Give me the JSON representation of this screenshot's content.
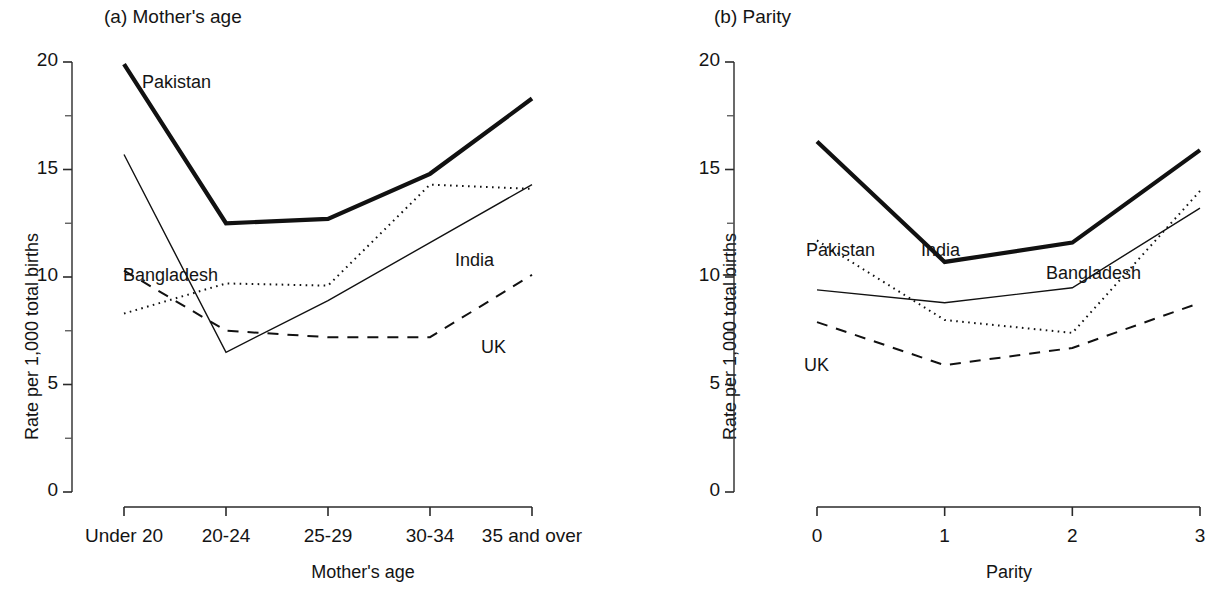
{
  "figure": {
    "panels": [
      {
        "id": "a",
        "title": "(a) Mother's age",
        "xlabel": "Mother's age",
        "ylabel": "Rate per 1,000 total births",
        "xticklabels": [
          "Under 20",
          "20-24",
          "25-29",
          "30-34",
          "35 and over"
        ],
        "yticklabels": [
          "0",
          "5",
          "10",
          "15",
          "20"
        ],
        "series_labels": {
          "pakistan": "Pakistan",
          "bangladesh": "Bangladesh",
          "india": "India",
          "uk": "UK"
        }
      },
      {
        "id": "b",
        "title": "(b) Parity",
        "xlabel": "Parity",
        "ylabel": "Rate per 1,000 total births",
        "xticklabels": [
          "0",
          "1",
          "2",
          "3"
        ],
        "yticklabels": [
          "0",
          "5",
          "10",
          "15",
          "20"
        ],
        "series_labels": {
          "pakistan": "Pakistan",
          "bangladesh": "Bangladesh",
          "india": "India",
          "uk": "UK"
        }
      }
    ]
  },
  "chart_data": [
    {
      "type": "line",
      "title": "(a) Mother's age",
      "xlabel": "Mother's age",
      "ylabel": "Rate per 1,000 total births",
      "categories": [
        "Under 20",
        "20-24",
        "25-29",
        "30-34",
        "35 and over"
      ],
      "ylim": [
        0,
        20
      ],
      "yticks": [
        0,
        5,
        10,
        15,
        20
      ],
      "yminorticks": [
        2.5,
        7.5,
        12.5,
        17.5
      ],
      "grid": false,
      "legend": "inline-labels",
      "series": [
        {
          "name": "Pakistan",
          "style": "thick-solid",
          "values": [
            19.9,
            12.5,
            12.7,
            14.8,
            18.3
          ]
        },
        {
          "name": "India",
          "style": "thin-solid",
          "values": [
            15.7,
            6.5,
            8.9,
            11.6,
            14.3
          ]
        },
        {
          "name": "Bangladesh",
          "style": "dotted",
          "values": [
            8.3,
            9.7,
            9.6,
            14.3,
            14.1
          ]
        },
        {
          "name": "UK",
          "style": "dashed",
          "values": [
            10.3,
            7.5,
            7.2,
            7.2,
            10.1
          ]
        }
      ]
    },
    {
      "type": "line",
      "title": "(b) Parity",
      "xlabel": "Parity",
      "ylabel": "Rate per 1,000 total births",
      "categories": [
        "0",
        "1",
        "2",
        "3"
      ],
      "ylim": [
        0,
        20
      ],
      "yticks": [
        0,
        5,
        10,
        15,
        20
      ],
      "yminorticks": [
        2.5,
        7.5,
        12.5,
        17.5
      ],
      "grid": false,
      "legend": "inline-labels",
      "series": [
        {
          "name": "Pakistan",
          "style": "thick-solid",
          "values": [
            16.3,
            10.7,
            11.6,
            15.9
          ]
        },
        {
          "name": "India",
          "style": "thin-solid",
          "values": [
            9.4,
            8.8,
            9.5,
            13.2
          ]
        },
        {
          "name": "Bangladesh",
          "style": "dotted",
          "values": [
            11.7,
            8.0,
            7.4,
            14.0
          ]
        },
        {
          "name": "UK",
          "style": "dashed",
          "values": [
            7.9,
            5.9,
            6.7,
            8.8
          ]
        }
      ]
    }
  ]
}
